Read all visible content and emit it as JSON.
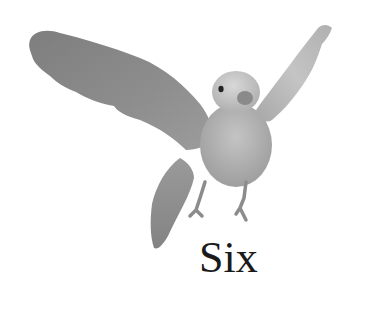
{
  "illustration": {
    "subject": "bird-flying",
    "colors": {
      "wing_dark": "#7a7a7a",
      "wing_mid": "#9a9a9a",
      "body": "#b4b4b4",
      "head": "#c8c8c8",
      "cheek": "#8a8a8a",
      "eye": "#222222",
      "legs": "#8c8c8c"
    }
  },
  "caption": {
    "text": "Six"
  }
}
